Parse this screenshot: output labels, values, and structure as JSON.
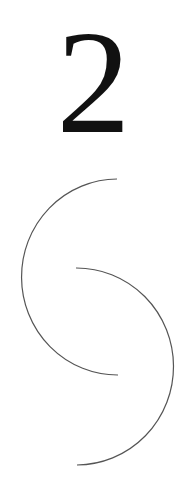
{
  "figure": {
    "numeral": "2",
    "colors": {
      "background": "#ffffff",
      "numeral": "#111111",
      "stroke": "#555555"
    },
    "arcs": [
      {
        "name": "upper-left-arc",
        "start": [
          117,
          179
        ],
        "end": [
          118,
          375
        ],
        "radius": 96,
        "side": "left"
      },
      {
        "name": "lower-right-arc",
        "start": [
          76,
          268
        ],
        "end": [
          77,
          465
        ],
        "radius": 97,
        "side": "right"
      }
    ]
  }
}
